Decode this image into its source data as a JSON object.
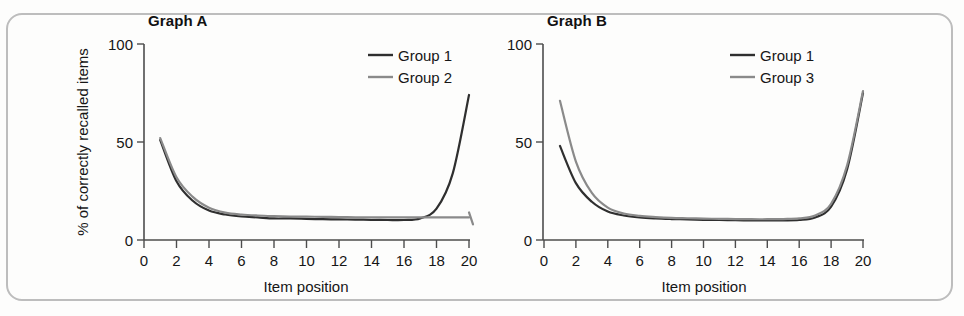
{
  "figure": {
    "background_color": "#fdfdfc",
    "frame_color": "#bdbdbd"
  },
  "panels": [
    {
      "id": "graph-a",
      "title": "Graph A",
      "legend": [
        {
          "label": "Group 1",
          "color": "#2f2f2f"
        },
        {
          "label": "Group 2",
          "color": "#8a8a8a"
        }
      ]
    },
    {
      "id": "graph-b",
      "title": "Graph B",
      "legend": [
        {
          "label": "Group 1",
          "color": "#2f2f2f"
        },
        {
          "label": "Group 3",
          "color": "#8a8a8a"
        }
      ]
    }
  ],
  "axis": {
    "x_title": "Item position",
    "y_title": "% of correctly recalled items",
    "x_ticks": [
      "0",
      "2",
      "4",
      "6",
      "8",
      "10",
      "12",
      "14",
      "16",
      "18",
      "20"
    ],
    "y_ticks": [
      "0",
      "50",
      "100"
    ]
  },
  "chart_data": [
    {
      "type": "line",
      "title": "Graph A",
      "xlabel": "Item position",
      "ylabel": "% of correctly recalled items",
      "xlim": [
        0,
        20
      ],
      "ylim": [
        0,
        100
      ],
      "xticks": [
        0,
        2,
        4,
        6,
        8,
        10,
        12,
        14,
        16,
        18,
        20
      ],
      "yticks": [
        0,
        50,
        100
      ],
      "grid": false,
      "legend_position": "top-right",
      "x": [
        1,
        2,
        3,
        4,
        5,
        6,
        7,
        8,
        9,
        10,
        11,
        12,
        13,
        14,
        15,
        16,
        17,
        18,
        19,
        20
      ],
      "series": [
        {
          "name": "Group 1",
          "color": "#2f2f2f",
          "values": [
            51,
            30,
            20,
            15,
            13,
            12,
            11.5,
            11,
            11,
            10.8,
            10.6,
            10.5,
            10.4,
            10.3,
            10.2,
            10.2,
            11,
            16,
            34,
            74
          ]
        },
        {
          "name": "Group 2",
          "color": "#8a8a8a",
          "values": [
            52,
            32,
            22,
            16.5,
            14,
            13,
            12.5,
            12.2,
            12,
            11.9,
            11.8,
            11.7,
            11.6,
            11.6,
            11.5,
            11.5,
            11.5,
            11.5,
            11.5,
            11.5
          ]
        }
      ],
      "annotations": [
        "Group 1 shows both a primacy and a recency effect (final upswing to ~74%).",
        "Group 2 shows a primacy effect only; the curve stays flat at ~11% through position 20."
      ]
    },
    {
      "type": "line",
      "title": "Graph B",
      "xlabel": "Item position",
      "ylabel": "% of correctly recalled items",
      "xlim": [
        0,
        20
      ],
      "ylim": [
        0,
        100
      ],
      "xticks": [
        0,
        2,
        4,
        6,
        8,
        10,
        12,
        14,
        16,
        18,
        20
      ],
      "yticks": [
        0,
        50,
        100
      ],
      "grid": false,
      "legend_position": "top-right",
      "x": [
        1,
        2,
        3,
        4,
        5,
        6,
        7,
        8,
        9,
        10,
        11,
        12,
        13,
        14,
        15,
        16,
        17,
        18,
        19,
        20
      ],
      "series": [
        {
          "name": "Group 1",
          "color": "#2f2f2f",
          "values": [
            48,
            29,
            19.5,
            14.5,
            12.5,
            11.5,
            11,
            10.7,
            10.5,
            10.3,
            10.2,
            10.1,
            10,
            10,
            10,
            10.2,
            11.5,
            17,
            36,
            75
          ]
        },
        {
          "name": "Group 3",
          "color": "#8a8a8a",
          "values": [
            71,
            40,
            24,
            16.5,
            13.5,
            12.3,
            11.7,
            11.3,
            11.1,
            10.9,
            10.8,
            10.7,
            10.6,
            10.6,
            10.7,
            11,
            12.5,
            18.5,
            38,
            76
          ]
        }
      ],
      "annotations": [
        "Both groups show primacy and recency effects; Group 3 has a stronger primacy effect (~71% at position 1)."
      ]
    }
  ]
}
